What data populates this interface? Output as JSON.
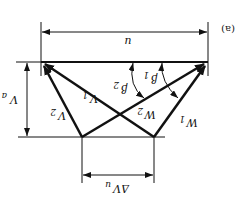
{
  "figure": {
    "panel_label": "(a)",
    "orientation": "rotated-180"
  },
  "labels": {
    "blade_speed": "u",
    "axial_velocity": "V",
    "axial_velocity_sub": "a",
    "abs_velocity_2": "V",
    "abs_velocity_2_sub": "2",
    "abs_velocity_1": "V",
    "abs_velocity_1_sub": "1",
    "rel_velocity_2": "W",
    "rel_velocity_2_sub": "2",
    "rel_velocity_1": "W",
    "rel_velocity_1_sub": "1",
    "angle_2": "β",
    "angle_2_sub": "2",
    "angle_1": "β",
    "angle_1_sub": "1",
    "delta_whirl": "ΔV",
    "delta_whirl_sub": "u"
  },
  "colors": {
    "ink": "#111111",
    "background": "#ffffff"
  }
}
